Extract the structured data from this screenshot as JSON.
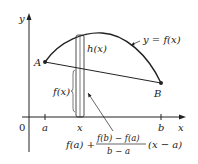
{
  "diagram": {
    "axes": {
      "y_label": "y",
      "x_label": "x",
      "origin_label": "0"
    },
    "ticks": {
      "a": "a",
      "x": "x",
      "b": "b"
    },
    "points": {
      "A": "A",
      "B": "B"
    },
    "labels": {
      "curve": "y = f(x)",
      "h": "h(x)",
      "fx": "f(x)",
      "secant_formula_prefix": "f(a) +",
      "secant_formula_numerator": "f(b) − f(a)",
      "secant_formula_denominator": "b − a",
      "secant_formula_suffix": "(x − a)"
    },
    "colors": {
      "stroke": "#222222",
      "background": "#ffffff"
    }
  }
}
